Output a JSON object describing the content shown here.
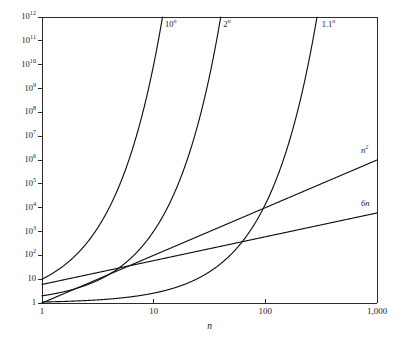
{
  "chart_data": {
    "type": "line",
    "title": "",
    "subtitle": "",
    "xlabel": "n",
    "ylabel": "",
    "xscale": "log",
    "yscale": "log",
    "xlim": [
      1,
      1000
    ],
    "ylim": [
      1,
      1000000000000
    ],
    "grid": false,
    "legend_position": "inline-curve-end-labels",
    "x_tick_labels": [
      "1",
      "10",
      "100",
      "1,000"
    ],
    "x_tick_values": [
      1,
      10,
      100,
      1000
    ],
    "y_tick_labels": [
      "1",
      "10",
      "10^2",
      "10^3",
      "10^4",
      "10^5",
      "10^6",
      "10^7",
      "10^8",
      "10^9",
      "10^10",
      "10^11",
      "10^12"
    ],
    "y_tick_values": [
      1,
      10,
      100,
      1000,
      10000,
      100000,
      1000000,
      10000000,
      100000000,
      1000000000,
      10000000000,
      100000000000,
      1000000000000
    ],
    "series": [
      {
        "name": "10^n",
        "label_base": "10",
        "label_exponent": "n",
        "formula": "pow",
        "base": 10,
        "label_x": 12.6,
        "label_y": 450000000000,
        "color": "#111111"
      },
      {
        "name": "2^n",
        "label_base": "2",
        "label_exponent": "n",
        "formula": "pow",
        "base": 2,
        "label_x": 42,
        "label_y": 450000000000,
        "color": "#111111"
      },
      {
        "name": "1.1^n",
        "label_base": "1.1",
        "label_exponent": "n",
        "formula": "pow",
        "base": 1.1,
        "label_x": 320,
        "label_y": 450000000000,
        "color": "#111111"
      },
      {
        "name": "n^2",
        "label_base": "n",
        "label_exponent": "2",
        "formula": "power_law",
        "exponent": 2,
        "coefficient": 1,
        "label_x": 720,
        "label_y": 2400000,
        "color": "#111111"
      },
      {
        "name": "6n",
        "label_base": "6n",
        "label_exponent": "",
        "formula": "linear",
        "exponent": 1,
        "coefficient": 6,
        "label_x": 720,
        "label_y": 14000,
        "color": "#111111"
      }
    ],
    "sample_points": {
      "10^n": [
        [
          1,
          10
        ],
        [
          2,
          100
        ],
        [
          4,
          10000
        ],
        [
          6,
          1000000
        ],
        [
          9,
          1000000000
        ],
        [
          12,
          1000000000000
        ]
      ],
      "2^n": [
        [
          1,
          2
        ],
        [
          10,
          1024
        ],
        [
          20,
          1048576
        ],
        [
          30,
          1073741824
        ],
        [
          40,
          1099511627776
        ]
      ],
      "1.1^n": [
        [
          1,
          1.1
        ],
        [
          10,
          2.59
        ],
        [
          50,
          117.4
        ],
        [
          100,
          13780
        ],
        [
          200,
          189905277
        ],
        [
          290,
          1140000000000
        ]
      ],
      "n^2": [
        [
          1,
          1
        ],
        [
          10,
          100
        ],
        [
          100,
          10000
        ],
        [
          1000,
          1000000
        ]
      ],
      "6n": [
        [
          1,
          6
        ],
        [
          10,
          60
        ],
        [
          100,
          600
        ],
        [
          1000,
          6000
        ]
      ]
    },
    "notable_intersections": [
      {
        "curves": [
          "n^2",
          "6n"
        ],
        "x": 6,
        "y": 36
      },
      {
        "curves": [
          "1.1^n",
          "6n"
        ],
        "x": 62,
        "y": 372
      },
      {
        "curves": [
          "1.1^n",
          "n^2"
        ],
        "x": 100,
        "y": 10000
      }
    ]
  },
  "axes": {
    "x_axis_name": "n",
    "y_axis_name": ""
  },
  "colors": {
    "background": "#ffffff",
    "axis": "#2b2b2b",
    "curve": "#111111",
    "text": "#1a1a1a"
  }
}
